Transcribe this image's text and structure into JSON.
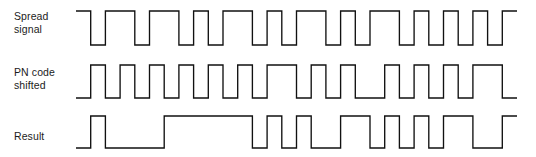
{
  "figure": {
    "background_color": "#ffffff",
    "line_color": "#111111",
    "text_color": "#1c1c1c"
  },
  "rows": [
    {
      "id": "spread-signal",
      "label": "Spread\nsignal",
      "label_lines": [
        "Spread",
        "signal"
      ]
    },
    {
      "id": "pn-code-shifted",
      "label": "PN code\nshifted",
      "label_lines": [
        "PN code",
        "shifted"
      ]
    },
    {
      "id": "result",
      "label": "Result",
      "label_lines": [
        "Result"
      ]
    }
  ],
  "chart_data": {
    "type": "line",
    "subtype": "digital-waveform",
    "xlabel": "",
    "ylabel": "",
    "grid": false,
    "legend": "left-labels",
    "chip_count": 30,
    "chip_width_px": 14.7,
    "x_start_px": 76,
    "x_end_px": 518,
    "levels": {
      "low": 0,
      "high": 1
    },
    "series": [
      {
        "name": "Spread signal",
        "values": [
          1,
          0,
          1,
          1,
          0,
          1,
          1,
          0,
          1,
          0,
          1,
          1,
          0,
          1,
          0,
          1,
          1,
          0,
          1,
          0,
          1,
          1,
          0,
          1,
          0,
          1,
          0,
          1,
          0,
          1
        ]
      },
      {
        "name": "PN code shifted",
        "values": [
          0,
          1,
          0,
          1,
          0,
          1,
          0,
          1,
          0,
          1,
          0,
          1,
          0,
          1,
          1,
          0,
          1,
          0,
          1,
          0,
          0,
          1,
          0,
          1,
          0,
          1,
          0,
          1,
          1,
          0
        ]
      },
      {
        "name": "Result",
        "values": [
          0,
          1,
          0,
          0,
          0,
          0,
          1,
          1,
          1,
          1,
          1,
          1,
          0,
          1,
          0,
          1,
          0,
          0,
          1,
          1,
          0,
          1,
          0,
          1,
          0,
          1,
          1,
          0,
          0,
          1
        ]
      }
    ]
  }
}
